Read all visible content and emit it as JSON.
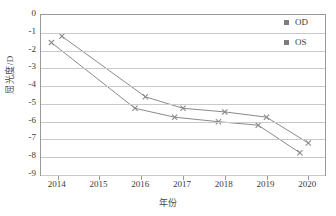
{
  "chart_data": {
    "type": "line",
    "title": "",
    "xlabel": "年份",
    "ylabel": "屈光度/D",
    "x": [
      2014,
      2015,
      2016,
      2017,
      2018,
      2019,
      2020
    ],
    "xlim": [
      2013.6,
      2020.4
    ],
    "ylim": [
      -9,
      0
    ],
    "xtick_labels": [
      "2014",
      "2015",
      "2016",
      "2017",
      "2018",
      "2019",
      "2020"
    ],
    "ytick_labels": [
      "0",
      "-1",
      "-2",
      "-3",
      "-4",
      "-5",
      "-6",
      "-7",
      "-8",
      "-9"
    ],
    "ytick_values": [
      0,
      -1,
      -2,
      -3,
      -4,
      -5,
      -6,
      -7,
      -8,
      -9
    ],
    "grid": "horizontal",
    "legend_position": "top-right",
    "marker": "x-cross",
    "series": [
      {
        "name": "OD",
        "color": "#8a8a8a",
        "x": [
          2014.1,
          2016.1,
          2017.0,
          2018.0,
          2019.0,
          2020.0
        ],
        "values": [
          -1.2,
          -4.6,
          -5.25,
          -5.45,
          -5.75,
          -7.2
        ]
      },
      {
        "name": "OS",
        "color": "#8a8a8a",
        "x": [
          2013.85,
          2015.85,
          2016.8,
          2017.85,
          2018.8,
          2019.8
        ],
        "values": [
          -1.55,
          -5.25,
          -5.75,
          -6.0,
          -6.2,
          -7.75
        ]
      }
    ],
    "legend": [
      {
        "label": "OD",
        "marker_color": "#7d7d7d"
      },
      {
        "label": "OS",
        "marker_color": "#7d7d7d"
      }
    ]
  },
  "colors": {
    "axis": "#9a9a9a",
    "grid": "#c9c9c9",
    "line": "#8a8a8a",
    "text": "#3a3a3a",
    "background": "#ffffff"
  }
}
